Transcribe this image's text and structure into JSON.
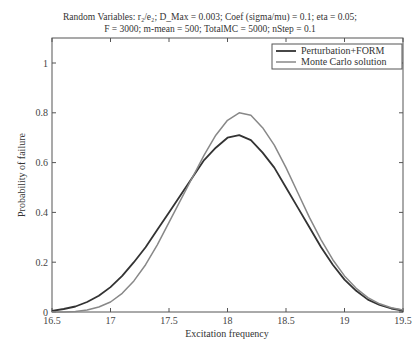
{
  "chart_data": {
    "type": "line",
    "title_line1": "Random Variables: r₂/e₂; D_Max = 0.003; Coef (sigma/mu) = 0.1; eta = 0.05;",
    "title_line2": "F = 3000; m-mean = 500; TotalMC = 5000; nStep = 0.1",
    "xlabel": "Excitation frequency",
    "ylabel": "Probability of failure",
    "xlim": [
      16.5,
      19.5
    ],
    "ylim": [
      0,
      1.1
    ],
    "xticks": [
      "16.5",
      "17",
      "17.5",
      "18",
      "18.5",
      "19",
      "19.5"
    ],
    "yticks": [
      "0",
      "0.2",
      "0.4",
      "0.6",
      "0.8",
      "1"
    ],
    "grid": false,
    "legend_position": "upper right",
    "x": [
      16.5,
      16.6,
      16.7,
      16.8,
      16.9,
      17.0,
      17.1,
      17.2,
      17.3,
      17.4,
      17.5,
      17.6,
      17.7,
      17.8,
      17.9,
      18.0,
      18.1,
      18.2,
      18.3,
      18.4,
      18.5,
      18.6,
      18.7,
      18.8,
      18.9,
      19.0,
      19.1,
      19.2,
      19.3,
      19.4,
      19.5
    ],
    "series": [
      {
        "name": "Perturbation+FORM",
        "color": "#333333",
        "values": [
          0.005,
          0.012,
          0.022,
          0.04,
          0.065,
          0.1,
          0.145,
          0.2,
          0.26,
          0.33,
          0.4,
          0.47,
          0.54,
          0.61,
          0.66,
          0.7,
          0.71,
          0.69,
          0.64,
          0.58,
          0.5,
          0.42,
          0.34,
          0.26,
          0.19,
          0.13,
          0.085,
          0.05,
          0.028,
          0.014,
          0.006
        ]
      },
      {
        "name": "Monte Carlo solution",
        "color": "#888888",
        "values": [
          0.0,
          0.0,
          0.002,
          0.008,
          0.02,
          0.04,
          0.075,
          0.125,
          0.19,
          0.27,
          0.36,
          0.45,
          0.54,
          0.63,
          0.71,
          0.77,
          0.8,
          0.79,
          0.74,
          0.67,
          0.58,
          0.48,
          0.38,
          0.29,
          0.21,
          0.145,
          0.095,
          0.058,
          0.033,
          0.017,
          0.008
        ]
      }
    ]
  }
}
